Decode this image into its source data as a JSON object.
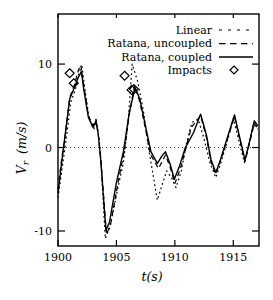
{
  "chart_data": {
    "type": "line",
    "title": "",
    "xlabel": "t(s)",
    "ylabel": "Vr (m/s)",
    "ylabel_parts": {
      "base": "V",
      "sub": "r",
      "units": "(m/s)"
    },
    "xlim": [
      1900,
      1917.2
    ],
    "ylim": [
      -11.8,
      16.0
    ],
    "x_ticks": [
      "1900",
      "1905",
      "1910",
      "1915"
    ],
    "x_tick_values": [
      1900,
      1905,
      1910,
      1915
    ],
    "y_ticks": [
      "-10",
      "0",
      "10"
    ],
    "y_tick_values": [
      -10,
      0,
      10
    ],
    "grid": false,
    "zero_line": true,
    "legend_position": "top-right",
    "colors": {
      "foreground": "#000000",
      "background": "#ffffff"
    },
    "series": [
      {
        "name": "Linear",
        "style": "dotted",
        "points": [
          [
            1900.0,
            -6.0
          ],
          [
            1900.35,
            -2.5
          ],
          [
            1900.65,
            0.5
          ],
          [
            1901.1,
            5.5
          ],
          [
            1901.5,
            7.0
          ],
          [
            1901.8,
            9.0
          ],
          [
            1902.05,
            9.7
          ],
          [
            1902.3,
            7.0
          ],
          [
            1902.65,
            3.6
          ],
          [
            1903.05,
            2.2
          ],
          [
            1903.3,
            3.0
          ],
          [
            1903.5,
            1.2
          ],
          [
            1903.7,
            -2.0
          ],
          [
            1904.05,
            -10.9
          ],
          [
            1904.45,
            -9.5
          ],
          [
            1905.1,
            -5.0
          ],
          [
            1905.6,
            -1.8
          ],
          [
            1906.0,
            3.0
          ],
          [
            1906.35,
            10.0
          ],
          [
            1906.8,
            8.0
          ],
          [
            1907.3,
            4.5
          ],
          [
            1907.8,
            -0.5
          ],
          [
            1908.5,
            -6.3
          ],
          [
            1908.9,
            -4.5
          ],
          [
            1909.3,
            -2.8
          ],
          [
            1909.7,
            -3.6
          ],
          [
            1910.1,
            -4.8
          ],
          [
            1910.55,
            -2.8
          ],
          [
            1911.0,
            0.5
          ],
          [
            1911.45,
            3.0
          ],
          [
            1912.0,
            3.4
          ],
          [
            1912.5,
            1.0
          ],
          [
            1913.0,
            -1.8
          ],
          [
            1913.5,
            -3.6
          ],
          [
            1913.95,
            -1.8
          ],
          [
            1914.5,
            0.8
          ],
          [
            1915.0,
            3.5
          ],
          [
            1915.45,
            1.0
          ],
          [
            1915.95,
            -1.8
          ],
          [
            1916.35,
            0.4
          ],
          [
            1916.7,
            2.8
          ],
          [
            1917.1,
            2.2
          ]
        ]
      },
      {
        "name": "Ratana, uncoupled",
        "style": "dashed",
        "points": [
          [
            1900.0,
            -5.0
          ],
          [
            1900.3,
            -1.5
          ],
          [
            1900.6,
            1.2
          ],
          [
            1901.0,
            6.0
          ],
          [
            1901.4,
            7.5
          ],
          [
            1901.75,
            9.3
          ],
          [
            1901.95,
            9.9
          ],
          [
            1902.2,
            7.5
          ],
          [
            1902.6,
            3.8
          ],
          [
            1903.0,
            2.6
          ],
          [
            1903.25,
            3.4
          ],
          [
            1903.45,
            1.6
          ],
          [
            1903.65,
            -1.2
          ],
          [
            1904.15,
            -10.4
          ],
          [
            1904.5,
            -9.2
          ],
          [
            1905.1,
            -4.5
          ],
          [
            1905.7,
            -0.2
          ],
          [
            1906.1,
            4.0
          ],
          [
            1906.55,
            7.4
          ],
          [
            1907.0,
            5.5
          ],
          [
            1907.5,
            2.2
          ],
          [
            1907.9,
            -0.8
          ],
          [
            1908.6,
            -2.5
          ],
          [
            1909.2,
            -0.9
          ],
          [
            1909.6,
            -2.4
          ],
          [
            1910.0,
            -4.3
          ],
          [
            1910.5,
            -2.4
          ],
          [
            1911.0,
            0.2
          ],
          [
            1911.4,
            2.4
          ],
          [
            1912.2,
            3.8
          ],
          [
            1912.7,
            1.2
          ],
          [
            1913.1,
            -1.8
          ],
          [
            1913.5,
            -3.2
          ],
          [
            1913.9,
            -1.6
          ],
          [
            1914.5,
            1.0
          ],
          [
            1915.1,
            3.7
          ],
          [
            1915.5,
            1.3
          ],
          [
            1916.0,
            -1.7
          ],
          [
            1916.4,
            0.6
          ],
          [
            1916.8,
            2.9
          ],
          [
            1917.1,
            2.3
          ]
        ]
      },
      {
        "name": "Ratana, coupled",
        "style": "solid",
        "points": [
          [
            1900.0,
            -5.5
          ],
          [
            1900.3,
            -2.0
          ],
          [
            1900.55,
            0.8
          ],
          [
            1901.0,
            5.8
          ],
          [
            1901.4,
            7.2
          ],
          [
            1901.7,
            8.3
          ],
          [
            1902.0,
            9.1
          ],
          [
            1902.2,
            7.0
          ],
          [
            1902.6,
            3.6
          ],
          [
            1903.0,
            2.4
          ],
          [
            1903.25,
            3.2
          ],
          [
            1903.45,
            1.5
          ],
          [
            1903.65,
            -1.5
          ],
          [
            1904.1,
            -9.9
          ],
          [
            1904.4,
            -9.0
          ],
          [
            1905.0,
            -4.2
          ],
          [
            1905.6,
            -0.5
          ],
          [
            1906.1,
            4.2
          ],
          [
            1906.6,
            7.2
          ],
          [
            1907.0,
            5.8
          ],
          [
            1907.5,
            2.5
          ],
          [
            1907.95,
            -0.5
          ],
          [
            1908.5,
            -1.9
          ],
          [
            1908.9,
            -1.0
          ],
          [
            1909.2,
            -0.5
          ],
          [
            1909.6,
            -2.0
          ],
          [
            1909.95,
            -3.8
          ],
          [
            1910.4,
            -2.2
          ],
          [
            1910.9,
            0.0
          ],
          [
            1911.1,
            0.5
          ],
          [
            1911.6,
            1.8
          ],
          [
            1912.2,
            4.0
          ],
          [
            1912.7,
            1.5
          ],
          [
            1913.1,
            -1.5
          ],
          [
            1913.5,
            -3.0
          ],
          [
            1913.9,
            -1.5
          ],
          [
            1914.5,
            1.2
          ],
          [
            1915.1,
            3.9
          ],
          [
            1915.5,
            1.5
          ],
          [
            1916.0,
            -1.5
          ],
          [
            1916.4,
            0.8
          ],
          [
            1916.8,
            3.2
          ],
          [
            1917.1,
            2.6
          ]
        ]
      },
      {
        "name": "Impacts",
        "style": "diamond",
        "points": [
          [
            1901.0,
            8.9
          ],
          [
            1901.35,
            7.7
          ],
          [
            1905.7,
            8.6
          ],
          [
            1906.3,
            6.9
          ],
          [
            1906.5,
            7.0
          ]
        ]
      }
    ]
  }
}
